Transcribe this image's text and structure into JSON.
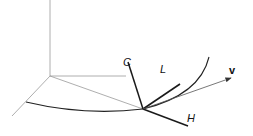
{
  "diagram": {
    "labels": {
      "C": "C",
      "L": "L",
      "v": "v",
      "H": "H"
    },
    "colors": {
      "thin": "#888888",
      "thick": "#1a1a1a",
      "background": "#ffffff"
    }
  }
}
